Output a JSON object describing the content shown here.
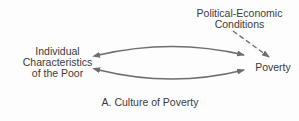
{
  "diagram": {
    "nodes": {
      "individual": {
        "lines": [
          "Individual",
          "Characteristics",
          "of the Poor"
        ]
      },
      "political": {
        "lines": [
          "Political-Economic",
          "Conditions"
        ]
      },
      "poverty": {
        "label": "Poverty"
      }
    },
    "edges": [
      {
        "from": "individual",
        "to": "poverty",
        "style": "solid",
        "arrows": "both",
        "curve": "up"
      },
      {
        "from": "individual",
        "to": "poverty",
        "style": "solid",
        "arrows": "both",
        "curve": "down"
      },
      {
        "from": "political",
        "to": "poverty",
        "style": "dashed",
        "arrows": "end"
      }
    ],
    "caption": "A. Culture of Poverty",
    "colors": {
      "line": "#6e6e6e",
      "text": "#3a3a3a",
      "background": "#fdfdfd"
    }
  }
}
